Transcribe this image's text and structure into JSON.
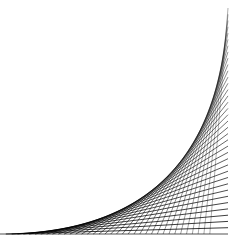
{
  "figure": {
    "type": "line-envelope string art",
    "line_count": 36,
    "colors": {
      "background": "#ffffff",
      "line": "#000000"
    },
    "geometry": {
      "baseline_y": 234,
      "right_edge_x": 228,
      "bottom_start_x": 0,
      "top_end_y": 8
    }
  }
}
